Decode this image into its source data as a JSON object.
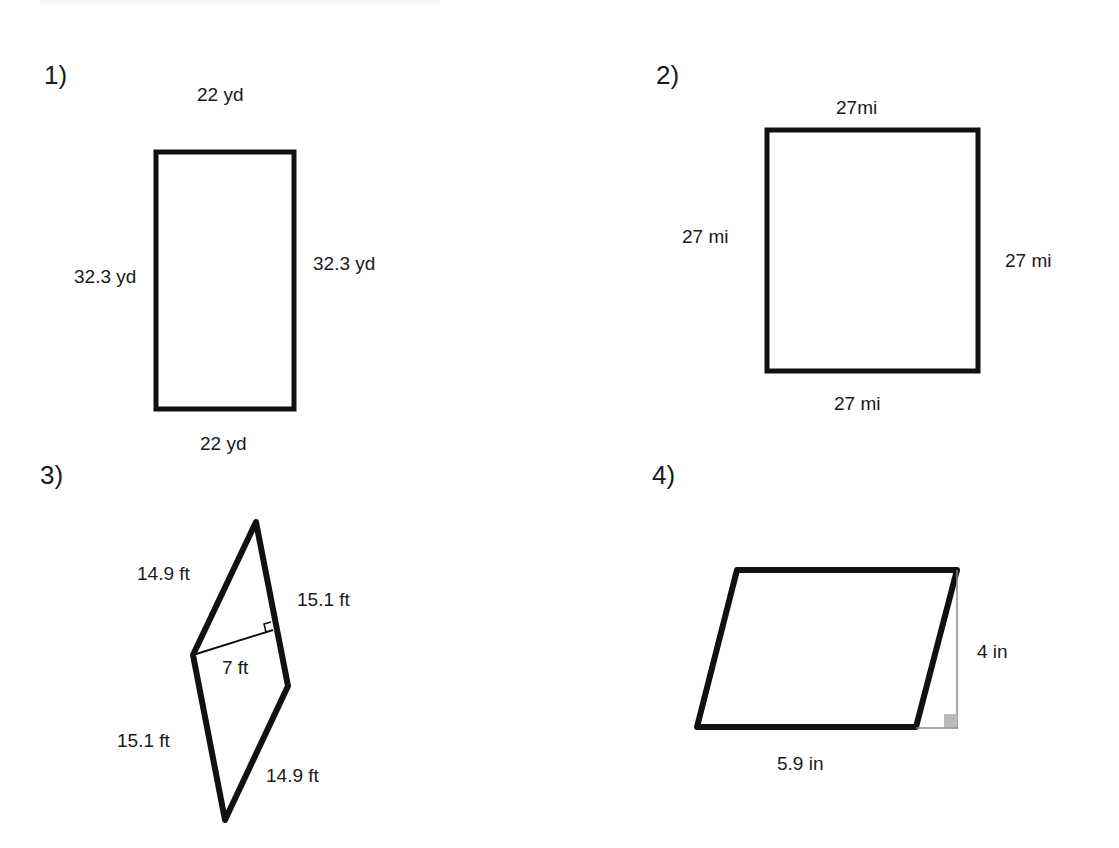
{
  "problems": [
    {
      "number": "1)",
      "shape": "rectangle",
      "labels": {
        "top": "22 yd",
        "left": "32.3 yd",
        "right": "32.3 yd",
        "bottom": "22 yd"
      }
    },
    {
      "number": "2)",
      "shape": "square",
      "labels": {
        "top": "27mi",
        "left": "27 mi",
        "right": "27 mi",
        "bottom": "27 mi"
      }
    },
    {
      "number": "3)",
      "shape": "rhombus-like parallelogram with height",
      "labels": {
        "upper_left": "14.9 ft",
        "upper_right": "15.1 ft",
        "height": "7 ft",
        "lower_left": "15.1 ft",
        "lower_right": "14.9 ft"
      }
    },
    {
      "number": "4)",
      "shape": "parallelogram with height",
      "labels": {
        "height": "4 in",
        "base": "5.9 in"
      }
    }
  ],
  "colors": {
    "stroke": "#111111",
    "helper_line": "#888888",
    "right_angle_fill": "#bbbbbb"
  }
}
